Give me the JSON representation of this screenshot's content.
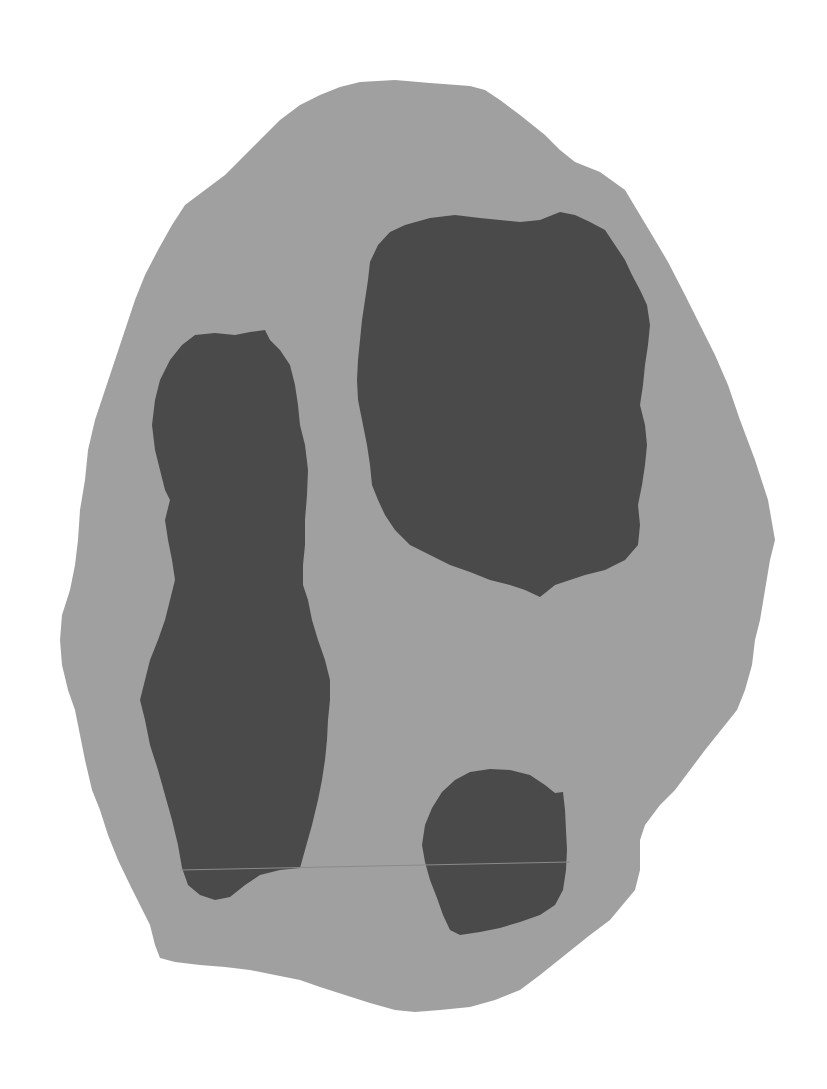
{
  "image": {
    "width": 827,
    "height": 1089,
    "background": "#ffffff"
  },
  "colors": {
    "background": "#ffffff",
    "outer_region": "#a0a0a0",
    "inner_regions": "#4a4a4a",
    "seam_line": "#8a8a8a"
  },
  "regions": {
    "outer": {
      "label": "outer-body",
      "shape": "irregular rounded blob, taller than wide"
    },
    "inner": [
      {
        "label": "left-elongated-blob",
        "shape": "tall vertical elongated mass"
      },
      {
        "label": "top-right-large-blob",
        "shape": "large rounded square mass"
      },
      {
        "label": "bottom-small-blob",
        "shape": "small rounded mass"
      }
    ]
  }
}
